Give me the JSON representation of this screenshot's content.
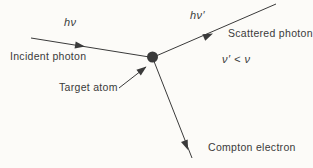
{
  "diagram": {
    "labels": {
      "incident_symbol": "hν",
      "scattered_symbol": "hν′",
      "incident_photon": "Incident photon",
      "scattered_photon": "Scattered photon",
      "frequency_relation": "ν′ < ν",
      "target_atom": "Target atom",
      "compton_electron": "Compton electron"
    },
    "colors": {
      "ink": "#3a3a3a",
      "background": "#fcfbf8"
    }
  }
}
